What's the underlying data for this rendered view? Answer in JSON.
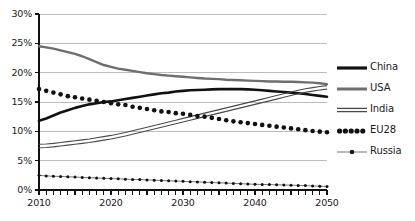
{
  "chart_data": {
    "type": "line",
    "title": "",
    "xlabel": "",
    "ylabel": "",
    "xlim": [
      2010,
      2050
    ],
    "ylim": [
      0,
      30
    ],
    "grid": true,
    "legend_position": "right",
    "y_tick_labels": [
      "30%",
      "25%",
      "20%",
      "15%",
      "10%",
      "5%",
      "0%"
    ],
    "y_tick_values": [
      30,
      25,
      20,
      15,
      10,
      5,
      0
    ],
    "x_tick_labels": [
      "2010",
      "2020",
      "2030",
      "2040",
      "2050"
    ],
    "x_tick_values": [
      2010,
      2020,
      2030,
      2040,
      2050
    ],
    "x_minor_tick_step": 1,
    "x": [
      2010,
      2011,
      2012,
      2013,
      2014,
      2015,
      2016,
      2017,
      2018,
      2019,
      2020,
      2021,
      2022,
      2023,
      2024,
      2025,
      2026,
      2027,
      2028,
      2029,
      2030,
      2031,
      2032,
      2033,
      2034,
      2035,
      2036,
      2037,
      2038,
      2039,
      2040,
      2041,
      2042,
      2043,
      2044,
      2045,
      2046,
      2047,
      2048,
      2049,
      2050
    ],
    "series": [
      {
        "name": "China",
        "color": "#111111",
        "style": "thick-solid",
        "values": [
          11.8,
          12.2,
          12.7,
          13.2,
          13.6,
          14.0,
          14.3,
          14.6,
          14.8,
          15.0,
          15.1,
          15.3,
          15.5,
          15.7,
          15.9,
          16.1,
          16.3,
          16.5,
          16.6,
          16.8,
          16.9,
          17.0,
          17.05,
          17.1,
          17.15,
          17.2,
          17.2,
          17.2,
          17.2,
          17.15,
          17.1,
          17.0,
          16.9,
          16.8,
          16.7,
          16.6,
          16.5,
          16.35,
          16.2,
          16.05,
          15.9
        ]
      },
      {
        "name": "USA",
        "color": "#6e6e6e",
        "style": "solid",
        "values": [
          24.5,
          24.3,
          24.1,
          23.8,
          23.5,
          23.2,
          22.8,
          22.3,
          21.8,
          21.3,
          21.0,
          20.7,
          20.5,
          20.3,
          20.1,
          19.9,
          19.75,
          19.6,
          19.5,
          19.4,
          19.3,
          19.2,
          19.1,
          19.0,
          18.95,
          18.9,
          18.8,
          18.75,
          18.7,
          18.65,
          18.6,
          18.55,
          18.5,
          18.5,
          18.45,
          18.45,
          18.4,
          18.35,
          18.3,
          18.2,
          18.05
        ]
      },
      {
        "name": "India",
        "color": "#4a4a4a",
        "style": "double",
        "values": [
          7.5,
          7.55,
          7.65,
          7.8,
          7.95,
          8.1,
          8.25,
          8.4,
          8.6,
          8.8,
          9.0,
          9.25,
          9.5,
          9.8,
          10.1,
          10.4,
          10.7,
          11.0,
          11.3,
          11.6,
          11.9,
          12.2,
          12.5,
          12.8,
          13.1,
          13.4,
          13.7,
          14.0,
          14.3,
          14.6,
          14.9,
          15.2,
          15.5,
          15.8,
          16.1,
          16.4,
          16.7,
          16.95,
          17.15,
          17.35,
          17.5
        ]
      },
      {
        "name": "EU28",
        "color": "#111111",
        "style": "dotted-thick",
        "values": [
          17.2,
          16.9,
          16.6,
          16.3,
          16.0,
          15.8,
          15.6,
          15.4,
          15.2,
          15.0,
          14.8,
          14.6,
          14.5,
          14.2,
          14.0,
          13.8,
          13.6,
          13.4,
          13.3,
          13.1,
          13.0,
          12.8,
          12.6,
          12.5,
          12.3,
          12.1,
          11.9,
          11.7,
          11.55,
          11.4,
          11.25,
          11.1,
          10.95,
          10.8,
          10.65,
          10.5,
          10.35,
          10.2,
          10.05,
          9.95,
          9.85
        ]
      },
      {
        "name": "Russia",
        "color": "#555555",
        "style": "dotted-marker",
        "values": [
          2.5,
          2.4,
          2.35,
          2.3,
          2.25,
          2.2,
          2.15,
          2.1,
          2.05,
          2.0,
          1.95,
          1.9,
          1.85,
          1.8,
          1.78,
          1.72,
          1.68,
          1.62,
          1.58,
          1.52,
          1.48,
          1.42,
          1.38,
          1.32,
          1.28,
          1.22,
          1.18,
          1.12,
          1.08,
          1.02,
          0.98,
          0.95,
          0.92,
          0.88,
          0.85,
          0.82,
          0.78,
          0.75,
          0.7,
          0.65,
          0.6
        ]
      }
    ]
  },
  "legend": {
    "items": [
      {
        "label": "China"
      },
      {
        "label": "USA"
      },
      {
        "label": "India"
      },
      {
        "label": "EU28"
      },
      {
        "label": "Russia"
      }
    ]
  }
}
